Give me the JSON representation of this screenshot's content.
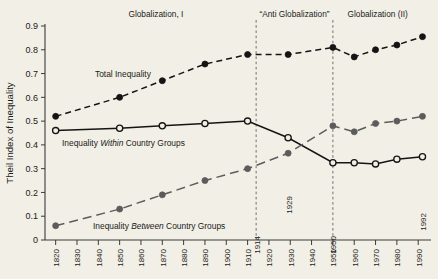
{
  "chart_data": {
    "type": "line",
    "title": "",
    "xlabel": "",
    "ylabel": "Theil Index of Inequality",
    "xlim": [
      1815,
      1996
    ],
    "ylim": [
      0,
      0.9
    ],
    "grid": false,
    "legend_position": "inline-annotations",
    "y_ticks": [
      "0",
      "0.1",
      "0.2",
      "0.3",
      "0.4",
      "0.5",
      "0.6",
      "0.7",
      "0.8",
      "0.9"
    ],
    "y_tick_values": [
      0,
      0.1,
      0.2,
      0.3,
      0.4,
      0.5,
      0.6,
      0.7,
      0.8,
      0.9
    ],
    "x_ticks": [
      "1820",
      "1830",
      "1840",
      "1850",
      "1860",
      "1870",
      "1880",
      "1890",
      "1900",
      "1910",
      "1920",
      "1930",
      "1940",
      "1950",
      "1960",
      "1970",
      "1980",
      "1990"
    ],
    "x_tick_values": [
      1820,
      1830,
      1840,
      1850,
      1860,
      1870,
      1880,
      1890,
      1900,
      1910,
      1920,
      1930,
      1940,
      1950,
      1960,
      1970,
      1980,
      1990
    ],
    "series": [
      {
        "name": "Total Inequality",
        "marker": "filled-black-circle",
        "line_style": "dashed",
        "color": "#141414",
        "x": [
          1820,
          1850,
          1870,
          1890,
          1910,
          1929,
          1950,
          1960,
          1970,
          1980,
          1992
        ],
        "values": [
          0.52,
          0.6,
          0.67,
          0.74,
          0.78,
          0.78,
          0.81,
          0.77,
          0.8,
          0.82,
          0.855
        ]
      },
      {
        "name": "Inequality Within Country Groups",
        "marker": "open-circle",
        "line_style": "solid",
        "color": "#141414",
        "x": [
          1820,
          1850,
          1870,
          1890,
          1910,
          1929,
          1950,
          1960,
          1970,
          1980,
          1992
        ],
        "values": [
          0.46,
          0.47,
          0.48,
          0.49,
          0.5,
          0.43,
          0.325,
          0.325,
          0.32,
          0.34,
          0.35
        ]
      },
      {
        "name": "Inequality Between Country Groups",
        "marker": "filled-gray-circle",
        "line_style": "long-dashed",
        "color": "#5c5c5c",
        "x": [
          1820,
          1850,
          1870,
          1890,
          1910,
          1929,
          1950,
          1960,
          1970,
          1980,
          1992
        ],
        "values": [
          0.06,
          0.13,
          0.19,
          0.25,
          0.3,
          0.365,
          0.48,
          0.455,
          0.49,
          0.5,
          0.52
        ]
      }
    ],
    "annotations": [
      {
        "text": "1914",
        "x": 1914,
        "orientation": "vertical"
      },
      {
        "text": "1929",
        "x": 1929,
        "orientation": "vertical"
      },
      {
        "text": "1950",
        "x": 1950,
        "orientation": "vertical"
      },
      {
        "text": "1992",
        "x": 1992,
        "orientation": "vertical"
      }
    ],
    "era_bands": [
      {
        "label": "Globalization, I",
        "start": 1820,
        "end": 1914
      },
      {
        "label": "“Anti Globalization”",
        "start": 1914,
        "end": 1950
      },
      {
        "label": "Globalization (II)",
        "start": 1950,
        "end": 1992
      }
    ],
    "dividers": [
      1914,
      1950
    ],
    "inline_labels": [
      {
        "text_before": "Total Inequality",
        "text_em": "",
        "text_after": ""
      },
      {
        "text_before": "Inequality ",
        "text_em": "Within",
        "text_after": " Country Groups"
      },
      {
        "text_before": "Inequality ",
        "text_em": "Between",
        "text_after": " Country Groups"
      }
    ]
  },
  "colors": {
    "background": "#f2f0e6",
    "axis": "#3a3a3a",
    "total": "#141414",
    "within": "#141414",
    "between": "#5c5c5c",
    "divider": "#6e6e6e"
  }
}
